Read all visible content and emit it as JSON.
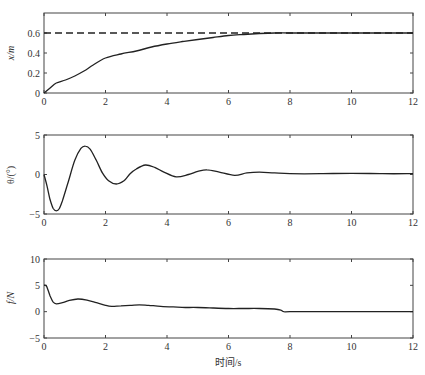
{
  "chart_data": [
    {
      "type": "line",
      "title": "",
      "xlabel": "",
      "ylabel": "x/m",
      "xlim": [
        0,
        12
      ],
      "ylim": [
        0,
        0.8
      ],
      "xticks": [
        0,
        2,
        4,
        6,
        8,
        10,
        12
      ],
      "yticks": [
        0,
        0.2,
        0.4,
        0.6
      ],
      "ytick_labels": [
        "0",
        "0.2",
        "0.4",
        "0.6"
      ],
      "grid": false,
      "series": [
        {
          "name": "x",
          "style": "solid",
          "x": [
            0,
            0.2,
            0.4,
            0.7,
            1.0,
            1.3,
            1.6,
            2.0,
            2.5,
            3.0,
            3.5,
            4.0,
            4.5,
            5.0,
            5.5,
            6.0,
            6.5,
            7.0,
            7.5,
            8,
            9,
            10,
            11,
            12
          ],
          "values": [
            0,
            0.05,
            0.1,
            0.13,
            0.17,
            0.22,
            0.28,
            0.35,
            0.39,
            0.42,
            0.46,
            0.49,
            0.515,
            0.535,
            0.555,
            0.575,
            0.585,
            0.595,
            0.6,
            0.6,
            0.6,
            0.6,
            0.6,
            0.6
          ]
        },
        {
          "name": "target",
          "style": "dashed",
          "x": [
            0,
            12
          ],
          "values": [
            0.6,
            0.6
          ]
        }
      ]
    },
    {
      "type": "line",
      "title": "",
      "xlabel": "",
      "ylabel": "θ/(°)",
      "xlim": [
        0,
        12
      ],
      "ylim": [
        -5,
        5
      ],
      "xticks": [
        0,
        2,
        4,
        6,
        8,
        10,
        12
      ],
      "yticks": [
        -5,
        0,
        5
      ],
      "ytick_labels": [
        "−5",
        "0",
        "5"
      ],
      "grid": false,
      "series": [
        {
          "name": "theta",
          "style": "solid",
          "x": [
            0,
            0.1,
            0.2,
            0.3,
            0.4,
            0.5,
            0.6,
            0.8,
            1.0,
            1.2,
            1.35,
            1.5,
            1.7,
            1.9,
            2.1,
            2.35,
            2.6,
            2.8,
            3.0,
            3.3,
            3.6,
            3.9,
            4.3,
            4.7,
            5.0,
            5.3,
            5.7,
            6.2,
            6.6,
            7.0,
            7.5,
            8.0,
            9.0,
            10.0,
            11.0,
            12.0
          ],
          "values": [
            0,
            -1.5,
            -3.2,
            -4.3,
            -4.6,
            -4.3,
            -3.3,
            -0.8,
            1.8,
            3.3,
            3.6,
            3.2,
            1.8,
            0.2,
            -0.8,
            -1.2,
            -0.8,
            0.1,
            0.7,
            1.2,
            0.9,
            0.3,
            -0.3,
            0.0,
            0.4,
            0.6,
            0.3,
            -0.1,
            0.2,
            0.3,
            0.2,
            0.1,
            0.1,
            0.15,
            0.1,
            0.1
          ]
        }
      ]
    },
    {
      "type": "line",
      "title": "",
      "xlabel": "时间/s",
      "ylabel": "f/N",
      "xlim": [
        0,
        12
      ],
      "ylim": [
        -5,
        10
      ],
      "xticks": [
        0,
        2,
        4,
        6,
        8,
        10,
        12
      ],
      "yticks": [
        -5,
        0,
        5,
        10
      ],
      "ytick_labels": [
        "−5",
        "0",
        "5",
        "10"
      ],
      "grid": false,
      "series": [
        {
          "name": "f",
          "style": "solid",
          "x": [
            0,
            0.05,
            0.1,
            0.2,
            0.3,
            0.4,
            0.6,
            0.8,
            1.1,
            1.4,
            1.7,
            2.0,
            2.2,
            2.5,
            2.8,
            3.1,
            3.4,
            3.8,
            4.2,
            4.6,
            5.0,
            5.5,
            6.0,
            6.5,
            7.0,
            7.5,
            7.7,
            7.8,
            8.0,
            9.0,
            10.0,
            11.0,
            12.0
          ],
          "values": [
            5,
            5,
            4.6,
            3.0,
            1.8,
            1.5,
            1.7,
            2.1,
            2.4,
            2.2,
            1.7,
            1.2,
            1.0,
            1.1,
            1.2,
            1.3,
            1.2,
            1.0,
            0.9,
            0.8,
            0.8,
            0.7,
            0.6,
            0.6,
            0.6,
            0.5,
            0.3,
            0.0,
            0.0,
            0.0,
            0.0,
            0.0,
            0.0
          ]
        }
      ]
    }
  ],
  "labels": {
    "top_ylabel": "x/m",
    "mid_ylabel": "θ/(°)",
    "bot_ylabel": "f/N",
    "xlabel": "时间/s"
  }
}
